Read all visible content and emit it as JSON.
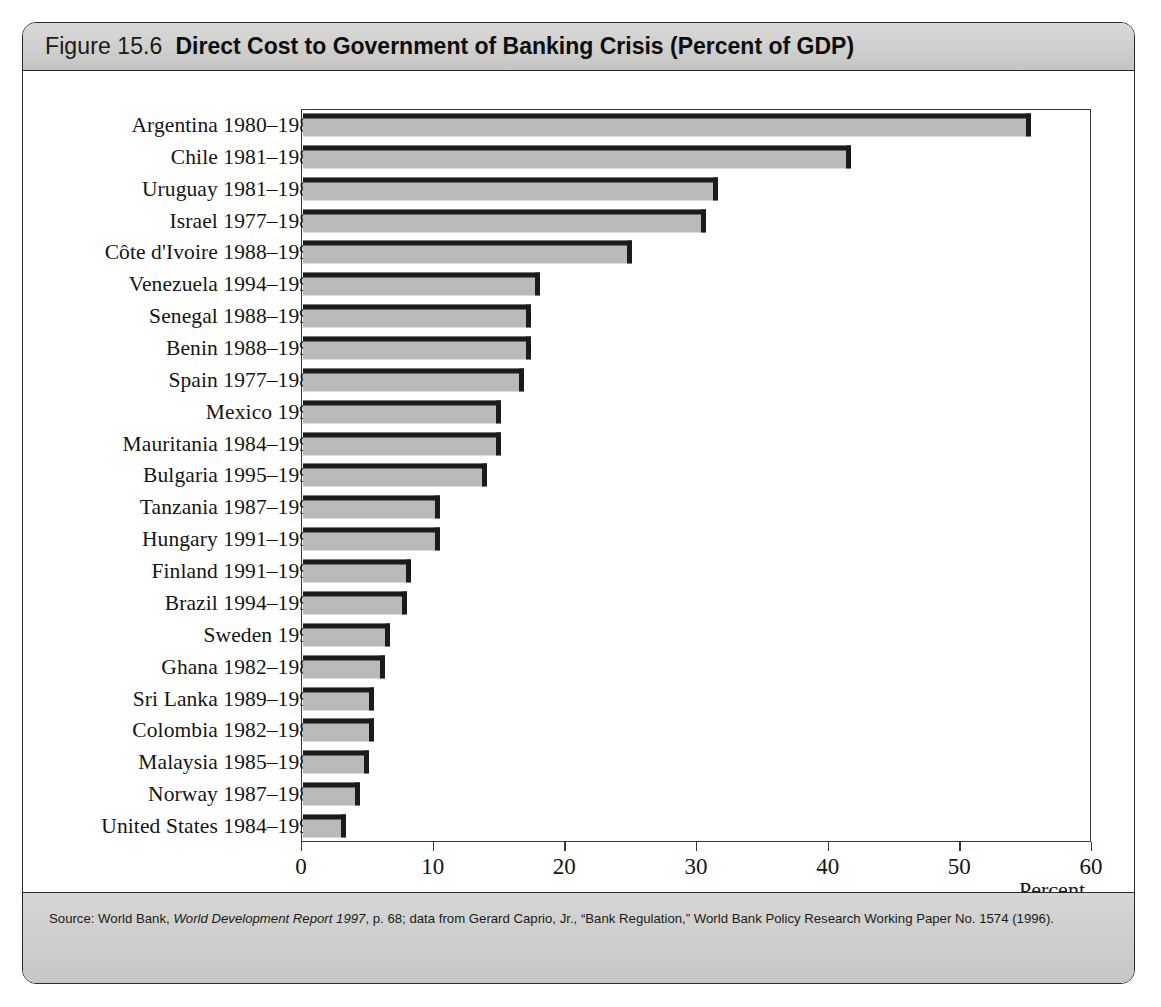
{
  "figure": {
    "number": "Figure 15.6",
    "title": "Direct Cost to Government of Banking Crisis (Percent of GDP)",
    "source_prefix": "Source: World Bank, ",
    "source_italic": "World Development Report 1997",
    "source_suffix": ", p. 68; data from Gerard Caprio, Jr., “Bank Regulation,” World Bank Policy Research Working Paper No. 1574 (1996)."
  },
  "colors": {
    "bar_face": "#b9b9b9",
    "bar_edge": "#1b1b1b",
    "header_band": "#cfcfcd",
    "frame": "#2b2b2b",
    "text": "#151515"
  },
  "chart_data": {
    "type": "bar",
    "orientation": "horizontal",
    "title": "Direct Cost to Government of Banking Crisis (Percent of GDP)",
    "xlabel": "Percent",
    "ylabel": "",
    "xlim": [
      0,
      60
    ],
    "xticks": [
      0,
      10,
      20,
      30,
      40,
      50,
      60
    ],
    "xtick_labels": [
      "0",
      "10",
      "20",
      "30",
      "40",
      "50",
      "60"
    ],
    "grid": false,
    "legend": false,
    "categories": [
      "Argentina 1980–1982",
      "Chile 1981–1983",
      "Uruguay 1981–1984",
      "Israel 1977–1983",
      "Côte d'Ivoire 1988–1991",
      "Venezuela 1994–1995",
      "Senegal 1988–1991",
      "Benin 1988–1990",
      "Spain 1977–1985",
      "Mexico 1995",
      "Mauritania 1984–1993",
      "Bulgaria 1995–1996",
      "Tanzania 1987–1993",
      "Hungary 1991–1993",
      "Finland 1991–1993",
      "Brazil 1994–1995",
      "Sweden 1991",
      "Ghana 1982–1989",
      "Sri Lanka 1989–1993",
      "Colombia 1982–1987",
      "Malaysia 1985–1988",
      "Norway 1987–1989",
      "United States 1984–1991"
    ],
    "values": [
      55.3,
      41.6,
      31.5,
      30.6,
      25.0,
      18.0,
      17.3,
      17.3,
      16.8,
      15.0,
      15.0,
      14.0,
      10.4,
      10.4,
      8.2,
      7.9,
      6.6,
      6.2,
      5.4,
      5.4,
      5.0,
      4.3,
      3.3
    ]
  }
}
